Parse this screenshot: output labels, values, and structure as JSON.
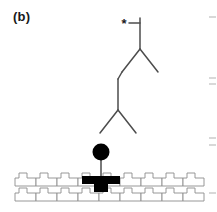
{
  "figure": {
    "panel_label": "(b)",
    "width": 217,
    "height": 212,
    "background_color": "#ffffff"
  },
  "colors": {
    "line": "#4d4d4d",
    "dark_line": "#333333",
    "fill_black": "#000000",
    "substrate_stroke": "#8c8c8c",
    "substrate_fill": "#ffffff",
    "substrate_shade": "#f0f0f0",
    "tick": "#b3b3b3",
    "label_text": "#1a1a1a"
  },
  "chain": {
    "top_terminal_marker": {
      "name": "asterisk-marker",
      "glyph": "*",
      "cx": 124,
      "cy": 23,
      "bond_x1": 129,
      "bond_y1": 23,
      "bond_x2": 140,
      "bond_y2": 23
    },
    "bonds": [
      {
        "id": "b1",
        "x1": 140,
        "y1": 18,
        "x2": 140,
        "y2": 49
      },
      {
        "id": "b2",
        "x1": 140,
        "y1": 49,
        "x2": 158,
        "y2": 72
      },
      {
        "id": "b3",
        "x1": 140,
        "y1": 49,
        "x2": 122,
        "y2": 72
      },
      {
        "id": "b4",
        "x1": 122,
        "y1": 72,
        "x2": 118,
        "y2": 79
      },
      {
        "id": "b5",
        "x1": 118,
        "y1": 79,
        "x2": 118,
        "y2": 110
      },
      {
        "id": "b6",
        "x1": 118,
        "y1": 110,
        "x2": 136,
        "y2": 133
      },
      {
        "id": "b7",
        "x1": 118,
        "y1": 110,
        "x2": 100,
        "y2": 133
      },
      {
        "id": "b8",
        "x1": 101,
        "y1": 152,
        "x2": 101,
        "y2": 181
      }
    ],
    "head_group": {
      "name": "filled-circle-head",
      "cx": 101,
      "cy": 152,
      "r": 8.5,
      "fill": "#000000"
    },
    "anchor": {
      "name": "t-shaped-anchor",
      "bar_x": 82,
      "bar_y": 176,
      "bar_w": 38,
      "bar_h": 8,
      "stem_x": 94,
      "stem_y": 184,
      "stem_w": 14,
      "stem_h": 8,
      "fill": "#000000"
    }
  },
  "substrate": {
    "name": "crenellated-substrate",
    "rows": [
      {
        "id": "row-top",
        "x": 15,
        "y": 173,
        "width": 187,
        "height": 13,
        "units": 9
      },
      {
        "id": "row-bottom",
        "x": 15,
        "y": 188,
        "width": 187,
        "height": 13,
        "units": 9
      }
    ],
    "unit_pattern": "castellated",
    "stroke": "#8c8c8c",
    "fill": "#ffffff"
  },
  "edge_ticks": {
    "name": "cropped-axis-ticks",
    "x": 209,
    "marks": [
      {
        "y": 17,
        "length": 7
      },
      {
        "y": 78,
        "length": 7
      },
      {
        "y": 84,
        "length": 7
      },
      {
        "y": 138,
        "length": 7
      },
      {
        "y": 145,
        "length": 7
      },
      {
        "y": 193,
        "length": 7
      }
    ],
    "color": "#bfbfbf"
  }
}
